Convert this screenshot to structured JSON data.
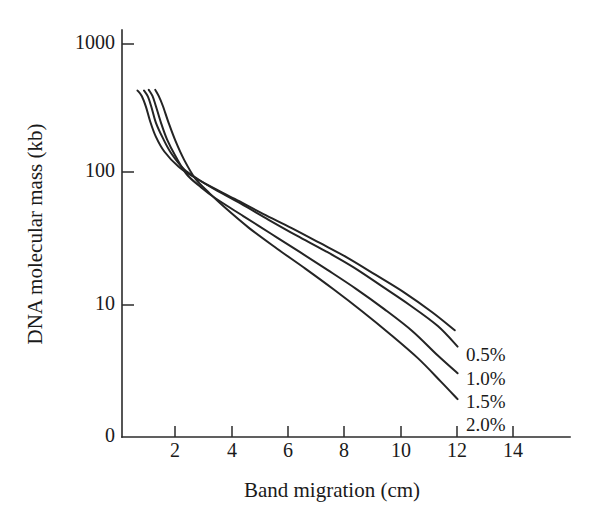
{
  "chart_data": {
    "type": "line",
    "title": "",
    "xlabel": "Band migration (cm)",
    "ylabel": "DNA molecular mass (kb)",
    "xlim": [
      0,
      15.8
    ],
    "ylim_log": [
      1,
      1000
    ],
    "yscale": "log",
    "grid": false,
    "legend_position": "right-inline-end-of-line",
    "y_tick_labels": [
      "1000",
      "100",
      "10",
      "0"
    ],
    "y_tick_values": [
      1000,
      100,
      10,
      0
    ],
    "x_tick_labels": [
      "2",
      "4",
      "6",
      "8",
      "10",
      "12",
      "14"
    ],
    "x_tick_values": [
      2,
      4,
      6,
      8,
      10,
      12,
      14
    ],
    "series": [
      {
        "name": "0.5%",
        "label": "0.5%",
        "color": "#242424",
        "x": [
          0.55,
          0.7,
          0.85,
          1.0,
          1.2,
          1.5,
          2.0,
          2.5,
          3.0,
          4.0,
          5.0,
          6.0,
          7.0,
          8.0,
          9.0,
          10.0,
          11.0,
          11.8
        ],
        "y": [
          440,
          400,
          330,
          255,
          195,
          150,
          115,
          97,
          84,
          65,
          50,
          39,
          30,
          23,
          17,
          12.5,
          8.8,
          6.4
        ]
      },
      {
        "name": "1.0%",
        "label": "1.0%",
        "color": "#242424",
        "x": [
          0.78,
          0.92,
          1.05,
          1.2,
          1.45,
          1.75,
          2.2,
          2.7,
          3.2,
          4.2,
          5.2,
          6.2,
          7.2,
          8.2,
          9.2,
          10.2,
          11.2,
          11.9
        ],
        "y": [
          440,
          395,
          325,
          250,
          190,
          145,
          110,
          92,
          79,
          60,
          45,
          34,
          26,
          19.5,
          14,
          10,
          6.9,
          4.8
        ]
      },
      {
        "name": "1.5%",
        "label": "1.5%",
        "color": "#242424",
        "x": [
          0.95,
          1.08,
          1.2,
          1.38,
          1.6,
          1.9,
          2.3,
          2.8,
          3.3,
          4.3,
          5.3,
          6.3,
          7.3,
          8.3,
          9.3,
          10.3,
          11.2,
          11.9
        ],
        "y": [
          445,
          400,
          335,
          250,
          185,
          138,
          100,
          80,
          66,
          48,
          35,
          25.5,
          18.5,
          13.3,
          9.3,
          6.3,
          4.1,
          3.0
        ]
      },
      {
        "name": "2.0%",
        "label": "2.0%",
        "color": "#242424",
        "x": [
          1.18,
          1.3,
          1.45,
          1.65,
          1.9,
          2.2,
          2.6,
          3.1,
          3.6,
          4.5,
          5.5,
          6.5,
          7.5,
          8.5,
          9.5,
          10.5,
          11.3,
          11.9
        ],
        "y": [
          445,
          400,
          335,
          250,
          180,
          130,
          93,
          72,
          57,
          39,
          27,
          19,
          13.2,
          9.0,
          6.0,
          3.9,
          2.6,
          1.9
        ]
      }
    ]
  },
  "accessibility": {
    "figure_description": "Semi-log plot of DNA molecular mass in kilobases versus band migration distance in centimeters for four agarose gel concentrations."
  }
}
